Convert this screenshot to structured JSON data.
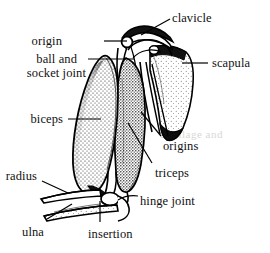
{
  "figure": {
    "background_color": "#ffffff",
    "ink_color": "#000000",
    "watermark_text": "cartilage and",
    "labels": [
      {
        "id": "clavicle",
        "text": "clavicle",
        "x": 172,
        "y": 12,
        "align": "left"
      },
      {
        "id": "origin",
        "text": "origin",
        "x": 62,
        "y": 35,
        "align": "right"
      },
      {
        "id": "ball-and",
        "text": "ball and",
        "x": 13,
        "y": 53,
        "align": "right"
      },
      {
        "id": "socket-joint",
        "text": "socket joint",
        "x": 9,
        "y": 67,
        "align": "right"
      },
      {
        "id": "scapula",
        "text": "scapula",
        "x": 212,
        "y": 57,
        "align": "left"
      },
      {
        "id": "biceps",
        "text": "biceps",
        "x": 24,
        "y": 113,
        "align": "right"
      },
      {
        "id": "origins",
        "text": "origins",
        "x": 163,
        "y": 140,
        "align": "left"
      },
      {
        "id": "triceps",
        "text": "triceps",
        "x": 155,
        "y": 167,
        "align": "left"
      },
      {
        "id": "radius",
        "text": "radius",
        "x": 32,
        "y": 170,
        "align": "right"
      },
      {
        "id": "hinge-joint",
        "text": "hinge joint",
        "x": 140,
        "y": 195,
        "align": "left"
      },
      {
        "id": "ulna",
        "text": "ulna",
        "x": 28,
        "y": 226,
        "align": "right"
      },
      {
        "id": "insertion",
        "text": "insertion",
        "x": 88,
        "y": 228,
        "align": "left"
      }
    ],
    "leader_lines": [
      {
        "id": "leader-clavicle",
        "from": [
          170,
          19
        ],
        "to": [
          141,
          35
        ]
      },
      {
        "id": "leader-origin",
        "from": [
          104,
          41
        ],
        "to": [
          127,
          41
        ]
      },
      {
        "id": "leader-ball-socket",
        "from": [
          88,
          59
        ],
        "to": [
          134,
          59
        ]
      },
      {
        "id": "leader-scapula",
        "from": [
          208,
          63
        ],
        "to": [
          182,
          63
        ]
      },
      {
        "id": "leader-biceps",
        "from": [
          68,
          119
        ],
        "to": [
          101,
          119
        ]
      },
      {
        "id": "leader-origins",
        "from": [
          161,
          136
        ],
        "to": [
          141,
          112
        ]
      },
      {
        "id": "leader-triceps",
        "from": [
          152,
          163
        ],
        "to": [
          128,
          123
        ]
      },
      {
        "id": "leader-hinge-joint",
        "from": [
          138,
          196
        ],
        "to": [
          118,
          200
        ]
      },
      {
        "id": "leader-insertion",
        "from": [
          100,
          222
        ],
        "to": [
          100,
          201
        ]
      },
      {
        "id": "leader-radius",
        "from": [
          42,
          181
        ],
        "to": [
          68,
          193
        ]
      },
      {
        "id": "leader-ulna",
        "from": [
          47,
          219
        ],
        "to": [
          72,
          204
        ]
      }
    ],
    "structures": [
      {
        "id": "clavicle-bone",
        "name": "clavicle"
      },
      {
        "id": "scapula-bone",
        "name": "scapula"
      },
      {
        "id": "humerus-head",
        "name": "ball-and-socket-joint"
      },
      {
        "id": "biceps-muscle",
        "name": "biceps"
      },
      {
        "id": "triceps-muscle",
        "name": "triceps"
      },
      {
        "id": "radius-bone",
        "name": "radius"
      },
      {
        "id": "ulna-bone",
        "name": "ulna"
      },
      {
        "id": "elbow-joint",
        "name": "hinge-joint"
      }
    ]
  }
}
